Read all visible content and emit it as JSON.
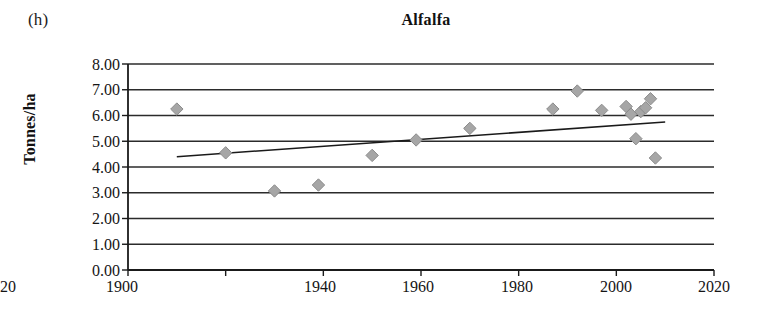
{
  "figure": {
    "panel_label": "(h)",
    "title": "Alfalfa"
  },
  "axes": {
    "y_label": "Tonnes/ha",
    "y_ticks": [
      "0.00",
      "1.00",
      "2.00",
      "3.00",
      "4.00",
      "5.00",
      "6.00",
      "7.00",
      "8.00"
    ],
    "x_ticks": [
      "1900",
      "1920",
      "1940",
      "1960",
      "1980",
      "2000",
      "2020"
    ]
  },
  "colors": {
    "marker_fill": "#a6a6a6",
    "marker_edge": "#8c8c8c",
    "axis": "#1a1a1a",
    "gridline": "#2b2b2b",
    "trendline": "#1a1a1a",
    "background": "#ffffff"
  },
  "chart_data": {
    "type": "scatter",
    "title": "Alfalfa",
    "xlabel": "",
    "ylabel": "Tonnes/ha",
    "xlim": [
      1900,
      2020
    ],
    "ylim": [
      0,
      8
    ],
    "xticks": [
      1900,
      1920,
      1940,
      1960,
      1980,
      2000,
      2020
    ],
    "yticks": [
      0,
      1,
      2,
      3,
      4,
      5,
      6,
      7,
      8
    ],
    "grid": "horizontal",
    "legend": "none",
    "marker": "diamond",
    "points": [
      {
        "x": 1910,
        "y": 6.25
      },
      {
        "x": 1920,
        "y": 4.55
      },
      {
        "x": 1930,
        "y": 3.07
      },
      {
        "x": 1939,
        "y": 3.3
      },
      {
        "x": 1950,
        "y": 4.45
      },
      {
        "x": 1959,
        "y": 5.05
      },
      {
        "x": 1970,
        "y": 5.5
      },
      {
        "x": 1987,
        "y": 6.25
      },
      {
        "x": 1992,
        "y": 6.95
      },
      {
        "x": 1997,
        "y": 6.2
      },
      {
        "x": 2002,
        "y": 6.35
      },
      {
        "x": 2003,
        "y": 6.05
      },
      {
        "x": 2004,
        "y": 5.1
      },
      {
        "x": 2005,
        "y": 6.15
      },
      {
        "x": 2006,
        "y": 6.3
      },
      {
        "x": 2007,
        "y": 6.65
      },
      {
        "x": 2008,
        "y": 4.35
      }
    ],
    "trendline": {
      "type": "linear",
      "x_start": 1910,
      "y_start": 4.4,
      "x_end": 2010,
      "y_end": 5.75
    }
  }
}
